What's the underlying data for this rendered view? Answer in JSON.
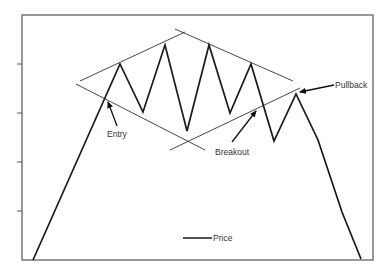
{
  "chart_data": {
    "type": "line",
    "title": "",
    "xlabel": "",
    "ylabel": "",
    "grid": false,
    "legend": {
      "position": "bottom-center",
      "entries": [
        "Price"
      ]
    },
    "y_ticks_count": 5,
    "series": [
      {
        "name": "Price",
        "points": [
          [
            33,
            260
          ],
          [
            120,
            64
          ],
          [
            143,
            112
          ],
          [
            165,
            45
          ],
          [
            187,
            131
          ],
          [
            209,
            45
          ],
          [
            230,
            113
          ],
          [
            251,
            64
          ],
          [
            274,
            141
          ],
          [
            296,
            94
          ],
          [
            318,
            140
          ],
          [
            342,
            212
          ],
          [
            361,
            259
          ]
        ]
      }
    ],
    "pattern_lines": [
      {
        "name": "upper-left-rising",
        "from": [
          80,
          81
        ],
        "to": [
          185,
          32
        ]
      },
      {
        "name": "lower-left-falling",
        "from": [
          76,
          84
        ],
        "to": [
          205,
          150
        ]
      },
      {
        "name": "upper-right-falling",
        "from": [
          175,
          29
        ],
        "to": [
          293,
          81
        ]
      },
      {
        "name": "lower-right-rising",
        "from": [
          170,
          150
        ],
        "to": [
          300,
          88
        ]
      }
    ],
    "annotations": [
      {
        "text": "Entry",
        "text_pos": [
          106,
          135
        ],
        "arrow_from": [
          116,
          125
        ],
        "arrow_to": [
          107,
          100
        ]
      },
      {
        "text": "Breakout",
        "text_pos": [
          215,
          154
        ],
        "arrow_from": [
          232,
          142
        ],
        "arrow_to": [
          258,
          108
        ]
      },
      {
        "text": "Pullback",
        "text_pos": [
          336,
          88
        ],
        "arrow_from": [
          333,
          85
        ],
        "arrow_to": [
          297,
          93
        ]
      }
    ]
  },
  "legend": {
    "price_label": "Price"
  },
  "annotations": {
    "entry": "Entry",
    "breakout": "Breakout",
    "pullback": "Pullback"
  },
  "colors": {
    "line": "#1a1a1a",
    "frame": "#444444",
    "thin_line": "#333333",
    "text": "#333333"
  }
}
